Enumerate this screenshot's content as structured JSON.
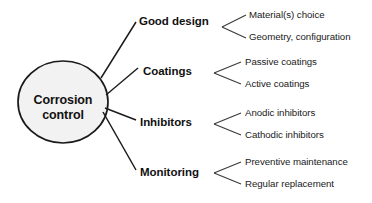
{
  "diagram": {
    "type": "mind-map",
    "root": {
      "label_line1": "Corrosion",
      "label_line2": "control",
      "shape": "ellipse",
      "fill_color": "#f2f2f2",
      "stroke_color": "#1a1a1a"
    },
    "branches": [
      {
        "label": "Good design",
        "leaves": [
          {
            "label": "Material(s) choice"
          },
          {
            "label": "Geometry, configuration"
          }
        ]
      },
      {
        "label": "Coatings",
        "leaves": [
          {
            "label": "Passive coatings"
          },
          {
            "label": "Active coatings"
          }
        ]
      },
      {
        "label": "Inhibitors",
        "leaves": [
          {
            "label": "Anodic inhibitors"
          },
          {
            "label": "Cathodic inhibitors"
          }
        ]
      },
      {
        "label": "Monitoring",
        "leaves": [
          {
            "label": "Preventive maintenance"
          },
          {
            "label": "Regular replacement"
          }
        ]
      }
    ]
  }
}
